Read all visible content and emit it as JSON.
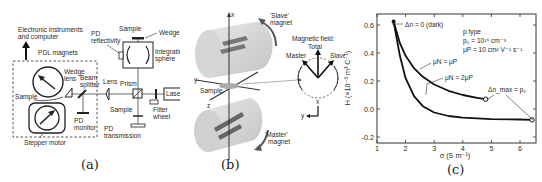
{
  "figure": {
    "panels": [
      {
        "id": "a",
        "caption": "(a)",
        "labels": {
          "electronics": [
            "Electronic instruments",
            "and computer"
          ],
          "pdl_magnets": "PDL magnets",
          "wedge_lens": [
            "Wedge",
            "lens"
          ],
          "beam_splitter": [
            "Beam",
            "splitter"
          ],
          "sample_left": "Sample",
          "stepper_motor": "Stepper motor",
          "pd_monitor": [
            "PD",
            "monitor"
          ],
          "lens": "Lens",
          "prism": "Prism",
          "laser": "Laser",
          "sample_top": "Sample",
          "wedge": "Wedge",
          "pd_reflectivity": [
            "PD",
            "reflectivity"
          ],
          "integrating_sphere": [
            "Integrating",
            "sphere"
          ],
          "sample_bottom": "Sample",
          "filter_wheel": [
            "Filter",
            "wheel"
          ],
          "pd_transmission": [
            "PD",
            "transmission"
          ]
        }
      },
      {
        "id": "b",
        "caption": "(b)",
        "labels": {
          "slave_magnet": [
            "'Slave'",
            "magnet"
          ],
          "master_magnet": [
            "'Master'",
            "magnet"
          ],
          "sample": "Sample",
          "axis_x": "x",
          "axis_y": "y",
          "axis_z": "z",
          "field_title": "Magnetic field:",
          "total": "Total",
          "master": "Master",
          "slave": "Slave",
          "inset_x": "x",
          "inset_y": "y"
        }
      },
      {
        "id": "c",
        "caption": "(c)"
      }
    ]
  },
  "chart_data": {
    "type": "line",
    "title": "",
    "xlabel": "σ (S m⁻¹)",
    "ylabel": "H (×10⁻³ m³ C⁻¹)",
    "xlim": [
      1,
      6.6
    ],
    "ylim": [
      -0.2,
      0.7
    ],
    "xticks": [
      1,
      2,
      3,
      4,
      5,
      6
    ],
    "yticks": [
      -0.2,
      0.0,
      0.2,
      0.4,
      0.6
    ],
    "ytick_labels": [
      "-0.2",
      "0.0",
      "0.2",
      "0.4",
      "0.6"
    ],
    "grid": false,
    "annotations": [
      "Δn = 0 (dark)",
      "p type",
      "p₀ = 10¹⁶ cm⁻³",
      "μP = 10 cm² V⁻¹ s⁻¹",
      "μN = μP",
      "μN = 2μP",
      "Δn_max = p₀"
    ],
    "series": [
      {
        "name": "μN = μP",
        "x": [
          1.58,
          1.8,
          2.0,
          2.3,
          2.6,
          3.0,
          3.5,
          4.0,
          4.5,
          4.8
        ],
        "y": [
          0.625,
          0.47,
          0.38,
          0.29,
          0.23,
          0.175,
          0.13,
          0.1,
          0.08,
          0.07
        ]
      },
      {
        "name": "μN = 2μP",
        "x": [
          1.58,
          1.8,
          2.0,
          2.3,
          2.6,
          3.0,
          3.5,
          4.0,
          5.0,
          6.0,
          6.42
        ],
        "y": [
          0.625,
          0.38,
          0.22,
          0.09,
          0.02,
          -0.025,
          -0.05,
          -0.062,
          -0.072,
          -0.075,
          -0.078
        ]
      }
    ]
  }
}
